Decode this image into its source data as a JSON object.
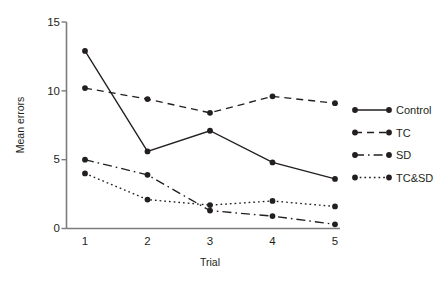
{
  "chart_data": {
    "type": "line",
    "title": "",
    "xlabel": "Trial",
    "ylabel": "Mean errors",
    "categories": [
      "1",
      "2",
      "3",
      "4",
      "5"
    ],
    "x": [
      1,
      2,
      3,
      4,
      5
    ],
    "xlim": [
      0.72,
      5.28
    ],
    "ylim": [
      0,
      15
    ],
    "yticks": [
      0,
      5,
      10,
      15
    ],
    "ytick_labels": [
      "0",
      "5",
      "10",
      "15"
    ],
    "xticks": [
      1,
      2,
      3,
      4,
      5
    ],
    "xtick_labels": [
      "1",
      "2",
      "3",
      "4",
      "5"
    ],
    "grid": false,
    "legend_position": "right",
    "marker": "filled-circle",
    "line_color": "#231f20",
    "series": [
      {
        "name": "Control",
        "style": "solid",
        "dash": "none",
        "values": [
          12.9,
          5.6,
          7.1,
          4.8,
          3.6
        ]
      },
      {
        "name": "TC",
        "style": "dashed",
        "dash": "7,5",
        "values": [
          10.2,
          9.4,
          8.4,
          9.6,
          9.1
        ]
      },
      {
        "name": "SD",
        "style": "dash-dot",
        "dash": "9,4,1.6,4",
        "values": [
          5.0,
          3.9,
          1.3,
          0.9,
          0.3
        ]
      },
      {
        "name": "TC&SD",
        "style": "dotted",
        "dash": "1.7,3",
        "values": [
          4.0,
          2.1,
          1.7,
          2.0,
          1.6
        ]
      }
    ]
  },
  "axes": {
    "y_label": "Mean errors",
    "x_label": "Trial",
    "y_tick_0": "0",
    "y_tick_1": "5",
    "y_tick_2": "10",
    "y_tick_3": "15",
    "x_tick_0": "1",
    "x_tick_1": "2",
    "x_tick_2": "3",
    "x_tick_3": "4",
    "x_tick_4": "5"
  },
  "legend": {
    "items": [
      {
        "label": "Control",
        "style": "solid"
      },
      {
        "label": "TC",
        "style": "dashed"
      },
      {
        "label": "SD",
        "style": "dash-dot"
      },
      {
        "label": "TC&SD",
        "style": "dotted"
      }
    ]
  },
  "caption": {
    "cut_off_line": ""
  }
}
